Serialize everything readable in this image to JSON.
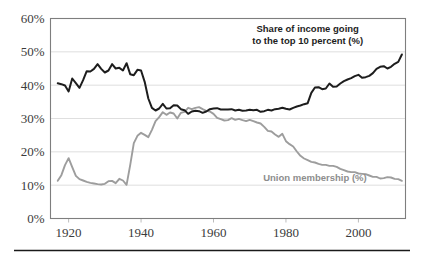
{
  "figure": {
    "background_color": "#ffffff",
    "footer_rule_color": "#1a1a1a"
  },
  "chart_data": {
    "type": "line",
    "title": "",
    "subtitle": "",
    "xlabel": "",
    "ylabel": "",
    "xlim": [
      1915,
      2013
    ],
    "ylim": [
      0,
      60
    ],
    "grid": true,
    "grid_axis": "y",
    "legend_position": "inline-annotation",
    "x_ticks": [
      1920,
      1940,
      1960,
      1980,
      2000
    ],
    "x_tick_labels": [
      "1920",
      "1940",
      "1960",
      "1980",
      "2000"
    ],
    "y_ticks": [
      0,
      10,
      20,
      30,
      40,
      50,
      60
    ],
    "y_tick_labels": [
      "0%",
      "10%",
      "20%",
      "30%",
      "40%",
      "50%",
      "60%"
    ],
    "annotations": [
      {
        "name": "top-income-share-label",
        "text_lines": [
          "Share of income going",
          "to the top 10 percent (%)"
        ],
        "color": "#1d1d1d",
        "x": 1986,
        "y": 56
      },
      {
        "name": "union-membership-label",
        "text_lines": [
          "Union membership (%)"
        ],
        "color": "#8d8d8d",
        "x": 1988,
        "y": 11.2
      }
    ],
    "series": [
      {
        "name": "Share of income going to the top 10 percent (%)",
        "short_name": "top_income_share",
        "color": "#1d1d1d",
        "line_width": 2.0,
        "x": [
          1917,
          1918,
          1919,
          1920,
          1921,
          1922,
          1923,
          1924,
          1925,
          1926,
          1927,
          1928,
          1929,
          1930,
          1931,
          1932,
          1933,
          1934,
          1935,
          1936,
          1937,
          1938,
          1939,
          1940,
          1941,
          1942,
          1943,
          1944,
          1945,
          1946,
          1947,
          1948,
          1949,
          1950,
          1951,
          1952,
          1953,
          1954,
          1955,
          1956,
          1957,
          1958,
          1959,
          1960,
          1961,
          1962,
          1963,
          1964,
          1965,
          1966,
          1967,
          1968,
          1969,
          1970,
          1971,
          1972,
          1973,
          1974,
          1975,
          1976,
          1977,
          1978,
          1979,
          1980,
          1981,
          1982,
          1983,
          1984,
          1985,
          1986,
          1987,
          1988,
          1989,
          1990,
          1991,
          1992,
          1993,
          1994,
          1995,
          1996,
          1997,
          1998,
          1999,
          2000,
          2001,
          2002,
          2003,
          2004,
          2005,
          2006,
          2007,
          2008,
          2009,
          2010,
          2011,
          2012
        ],
        "values": [
          40.6,
          40.3,
          39.9,
          38.1,
          42.0,
          40.6,
          39.2,
          41.5,
          44.2,
          44.1,
          44.9,
          46.3,
          44.9,
          43.8,
          44.4,
          46.3,
          45.0,
          45.2,
          44.4,
          46.6,
          43.3,
          43.0,
          44.6,
          44.4,
          41.0,
          36.0,
          33.2,
          32.4,
          33.0,
          34.4,
          33.0,
          33.1,
          34.0,
          33.9,
          32.8,
          32.5,
          31.4,
          32.1,
          32.3,
          32.2,
          31.7,
          32.1,
          32.8,
          33.0,
          33.1,
          32.7,
          32.7,
          32.7,
          32.8,
          32.4,
          32.6,
          32.3,
          32.4,
          32.6,
          32.5,
          32.6,
          32.0,
          32.2,
          32.6,
          32.4,
          32.8,
          32.9,
          33.2,
          32.9,
          32.7,
          33.2,
          33.6,
          33.9,
          34.3,
          34.6,
          37.7,
          39.3,
          39.4,
          38.8,
          39.0,
          40.5,
          39.5,
          39.6,
          40.5,
          41.2,
          41.7,
          42.1,
          42.7,
          43.1,
          42.2,
          42.4,
          42.8,
          43.6,
          44.9,
          45.5,
          45.7,
          45.0,
          45.5,
          46.4,
          47.0,
          49.2
        ]
      },
      {
        "name": "Union membership (%)",
        "short_name": "union_membership",
        "color": "#9d9d9d",
        "line_width": 1.9,
        "x": [
          1917,
          1918,
          1919,
          1920,
          1921,
          1922,
          1923,
          1924,
          1925,
          1926,
          1927,
          1928,
          1929,
          1930,
          1931,
          1932,
          1933,
          1934,
          1935,
          1936,
          1937,
          1938,
          1939,
          1940,
          1941,
          1942,
          1943,
          1944,
          1945,
          1946,
          1947,
          1948,
          1949,
          1950,
          1951,
          1952,
          1953,
          1954,
          1955,
          1956,
          1957,
          1958,
          1959,
          1960,
          1961,
          1962,
          1963,
          1964,
          1965,
          1966,
          1967,
          1968,
          1969,
          1970,
          1971,
          1972,
          1973,
          1974,
          1975,
          1976,
          1977,
          1978,
          1979,
          1980,
          1981,
          1982,
          1983,
          1984,
          1985,
          1986,
          1987,
          1988,
          1989,
          1990,
          1991,
          1992,
          1993,
          1994,
          1995,
          1996,
          1997,
          1998,
          1999,
          2000,
          2001,
          2002,
          2003,
          2004,
          2005,
          2006,
          2007,
          2008,
          2009,
          2010,
          2011,
          2012
        ],
        "values": [
          11.3,
          13.0,
          16.0,
          18.1,
          15.4,
          12.8,
          11.8,
          11.4,
          11.0,
          10.7,
          10.5,
          10.3,
          10.2,
          10.4,
          11.2,
          11.3,
          10.6,
          11.9,
          11.4,
          10.1,
          16.0,
          22.6,
          24.8,
          25.7,
          25.1,
          24.4,
          26.6,
          29.2,
          30.4,
          31.9,
          31.1,
          31.8,
          31.5,
          30.0,
          31.7,
          32.0,
          33.2,
          32.8,
          33.2,
          33.4,
          32.8,
          32.3,
          32.1,
          31.4,
          30.2,
          29.8,
          29.4,
          29.5,
          30.1,
          29.6,
          29.9,
          29.5,
          29.2,
          29.6,
          29.2,
          28.8,
          28.5,
          27.5,
          26.3,
          26.1,
          25.2,
          24.5,
          25.4,
          23.2,
          22.3,
          21.6,
          20.1,
          18.8,
          18.0,
          17.5,
          17.0,
          16.8,
          16.4,
          16.1,
          16.1,
          15.8,
          15.8,
          15.5,
          14.9,
          14.5,
          14.1,
          13.9,
          13.9,
          13.5,
          13.4,
          13.3,
          12.9,
          12.5,
          12.5,
          12.0,
          12.1,
          12.4,
          12.3,
          11.9,
          11.8,
          11.3
        ]
      }
    ]
  }
}
